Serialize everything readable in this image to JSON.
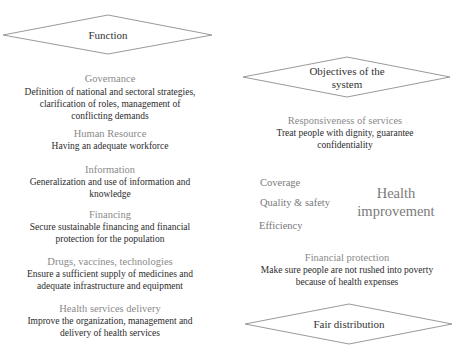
{
  "diagram": {
    "function_shape": {
      "label": "Function"
    },
    "function_items": [
      {
        "title": "Governance",
        "lines": [
          "Definition of national and sectoral strategies,",
          "clarification of roles, management of",
          "conflicting demands"
        ]
      },
      {
        "title": "Human Resource",
        "lines": [
          "Having an adequate workforce"
        ]
      },
      {
        "title": "Information",
        "lines": [
          "Generalization and use of information and",
          "knowledge"
        ]
      },
      {
        "title": "Financing",
        "lines": [
          "Secure sustainable financing and financial",
          "protection for the population"
        ]
      },
      {
        "title": "Drugs, vaccines, technologies",
        "lines": [
          "Ensure a sufficient supply of medicines and",
          "adequate infrastructure and equipment"
        ]
      },
      {
        "title": "Health services delivery",
        "lines": [
          "Improve the organization, management and",
          "delivery of health services"
        ]
      }
    ],
    "objectives_shape": {
      "label_line1": "Objectives of the",
      "label_line2": "system"
    },
    "responsiveness": {
      "title": "Responsiveness of services",
      "lines": [
        "Treat people with dignity, guarantee",
        "confidentiality"
      ]
    },
    "intermediate": [
      "Coverage",
      "Quality & safety",
      "Efficiency"
    ],
    "health_improvement": {
      "line1": "Health",
      "line2": "improvement"
    },
    "financial_protection": {
      "title": "Financial protection",
      "lines": [
        "Make sure people are not rushed into poverty",
        "because of health expenses"
      ]
    },
    "fair_shape": {
      "label": "Fair distribution"
    },
    "colors": {
      "stroke": "#9a9a9a",
      "title_text": "#8a8a8a",
      "body_text": "#2b2b2b"
    }
  }
}
